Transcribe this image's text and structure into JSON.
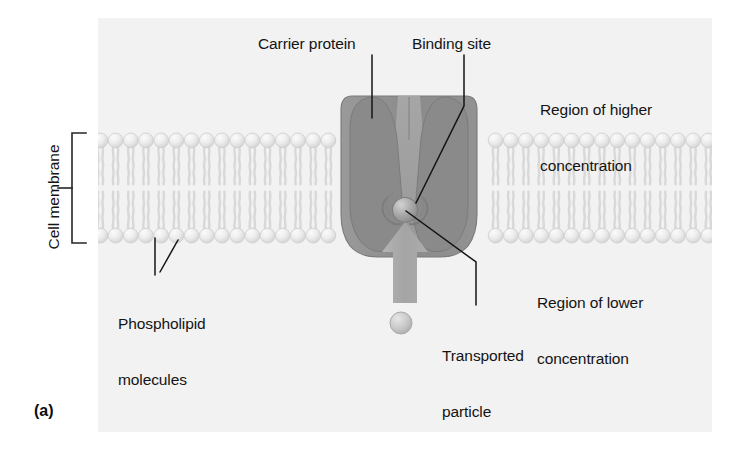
{
  "figure": {
    "panel_letter": "(a)",
    "background_color": "#ffffff",
    "panel_color": "#f2f2f2"
  },
  "labels": {
    "carrier_protein": "Carrier protein",
    "binding_site": "Binding site",
    "region_higher_line1": "Region of higher",
    "region_higher_line2": "concentration",
    "region_lower_line1": "Region of lower",
    "region_lower_line2": "concentration",
    "phospholipid_line1": "Phospholipid",
    "phospholipid_line2": "molecules",
    "transported_line1": "Transported",
    "transported_line2": "particle",
    "cell_membrane": "Cell membrane"
  },
  "colors": {
    "text": "#141414",
    "protein_fill": "#8f8f8f",
    "protein_lobe": "#848484",
    "protein_channel": "#a2a2a2",
    "protein_edge": "#6f6f6f",
    "membrane_head": "#e3e3e3",
    "membrane_head_edge": "#c9c9c9",
    "membrane_tail": "#dedede",
    "arrow_fill": "#a8a8a8",
    "particle_fill": "#bdbdbd",
    "particle_bound": "#9a9a9a",
    "leader_line": "#141414",
    "bracket": "#262626"
  },
  "geometry": {
    "membrane_top_y": 133,
    "membrane_bottom_y": 243,
    "membrane_left_x": 98,
    "membrane_right_x": 712,
    "head_diameter": 15,
    "protein_center_x": 408,
    "binding_site_x": 404,
    "binding_site_y": 209
  }
}
